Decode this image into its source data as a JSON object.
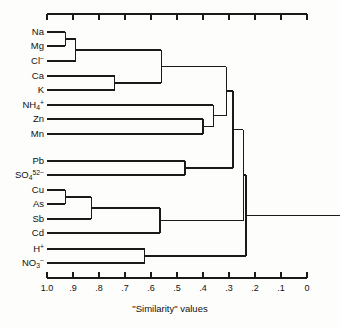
{
  "figure": {
    "axis_title": "\"Similarity\" values",
    "leaf_label_x": 44,
    "axis": {
      "x_left_px": 47,
      "x_right_px": 307,
      "value_left": 1.0,
      "value_right": 0.0,
      "top_rule_y": 14,
      "bottom_rule_y": 278,
      "tick_len": 6,
      "tick_labels": [
        "1.0",
        ".9",
        ".8",
        ".7",
        ".6",
        ".5",
        ".4",
        ".3",
        ".2",
        ".1",
        "0"
      ],
      "tick_values": [
        1.0,
        0.9,
        0.8,
        0.7,
        0.6,
        0.5,
        0.4,
        0.3,
        0.2,
        0.1,
        0.0
      ]
    },
    "line_color": "#1a1a1a",
    "line_width": 1.4
  },
  "chart_data": {
    "type": "dendrogram",
    "title": "",
    "xlabel": "\"Similarity\" values",
    "ylabel": "",
    "xlim": [
      1.0,
      0.0
    ],
    "x_axis_direction": "reversed",
    "grid": false,
    "legend": "none",
    "leaves": [
      {
        "id": "Na",
        "label_html": "Na",
        "y": 32
      },
      {
        "id": "Mg",
        "label_html": "Mg",
        "y": 46
      },
      {
        "id": "Cl",
        "label_html": "Cl<sup>−</sup>",
        "y": 61
      },
      {
        "id": "Ca",
        "label_html": "Ca",
        "y": 76
      },
      {
        "id": "K",
        "label_html": "K",
        "y": 90
      },
      {
        "id": "NH4",
        "label_html": "NH<sub>4</sub><sup>+</sup>",
        "y": 105
      },
      {
        "id": "Zn",
        "label_html": "Zn",
        "y": 119
      },
      {
        "id": "Mn",
        "label_html": "Mn",
        "y": 134
      },
      {
        "id": "Pb",
        "label_html": "Pb",
        "y": 161
      },
      {
        "id": "SO4",
        "label_html": "SO<sub>4</sub><sup>52−</sup>",
        "y": 175
      },
      {
        "id": "Cu",
        "label_html": "Cu",
        "y": 190
      },
      {
        "id": "As",
        "label_html": "As",
        "y": 204
      },
      {
        "id": "Sb",
        "label_html": "Sb",
        "y": 219
      },
      {
        "id": "Cd",
        "label_html": "Cd",
        "y": 233
      },
      {
        "id": "H",
        "label_html": "H<sup>+</sup>",
        "y": 249
      },
      {
        "id": "NO3",
        "label_html": "NO<sub>3</sub><sup>−</sup>",
        "y": 263
      }
    ],
    "merges": [
      {
        "id": "m1",
        "left": "Na",
        "right": "Mg",
        "similarity": 0.93
      },
      {
        "id": "m2",
        "left": "m1",
        "right": "Cl",
        "similarity": 0.89
      },
      {
        "id": "m3",
        "left": "Ca",
        "right": "K",
        "similarity": 0.74
      },
      {
        "id": "m4",
        "left": "m2",
        "right": "m3",
        "similarity": 0.56
      },
      {
        "id": "m5",
        "left": "Zn",
        "right": "Mn",
        "similarity": 0.4
      },
      {
        "id": "m6",
        "left": "NH4",
        "right": "m5",
        "similarity": 0.36
      },
      {
        "id": "m7",
        "left": "m4",
        "right": "m6",
        "similarity": 0.31
      },
      {
        "id": "m8",
        "left": "Pb",
        "right": "SO4",
        "similarity": 0.47
      },
      {
        "id": "m9",
        "left": "m7",
        "right": "m8",
        "similarity": 0.285
      },
      {
        "id": "m10",
        "left": "Cu",
        "right": "As",
        "similarity": 0.93
      },
      {
        "id": "m11",
        "left": "m10",
        "right": "Sb",
        "similarity": 0.83
      },
      {
        "id": "m12",
        "left": "m11",
        "right": "Cd",
        "similarity": 0.565
      },
      {
        "id": "m13",
        "left": "m9",
        "right": "m12",
        "similarity": 0.245
      },
      {
        "id": "m14",
        "left": "H",
        "right": "NO3",
        "similarity": 0.625
      },
      {
        "id": "m15",
        "left": "m13",
        "right": "m14",
        "similarity": 0.235
      }
    ],
    "root_extends_to_px": 340
  }
}
